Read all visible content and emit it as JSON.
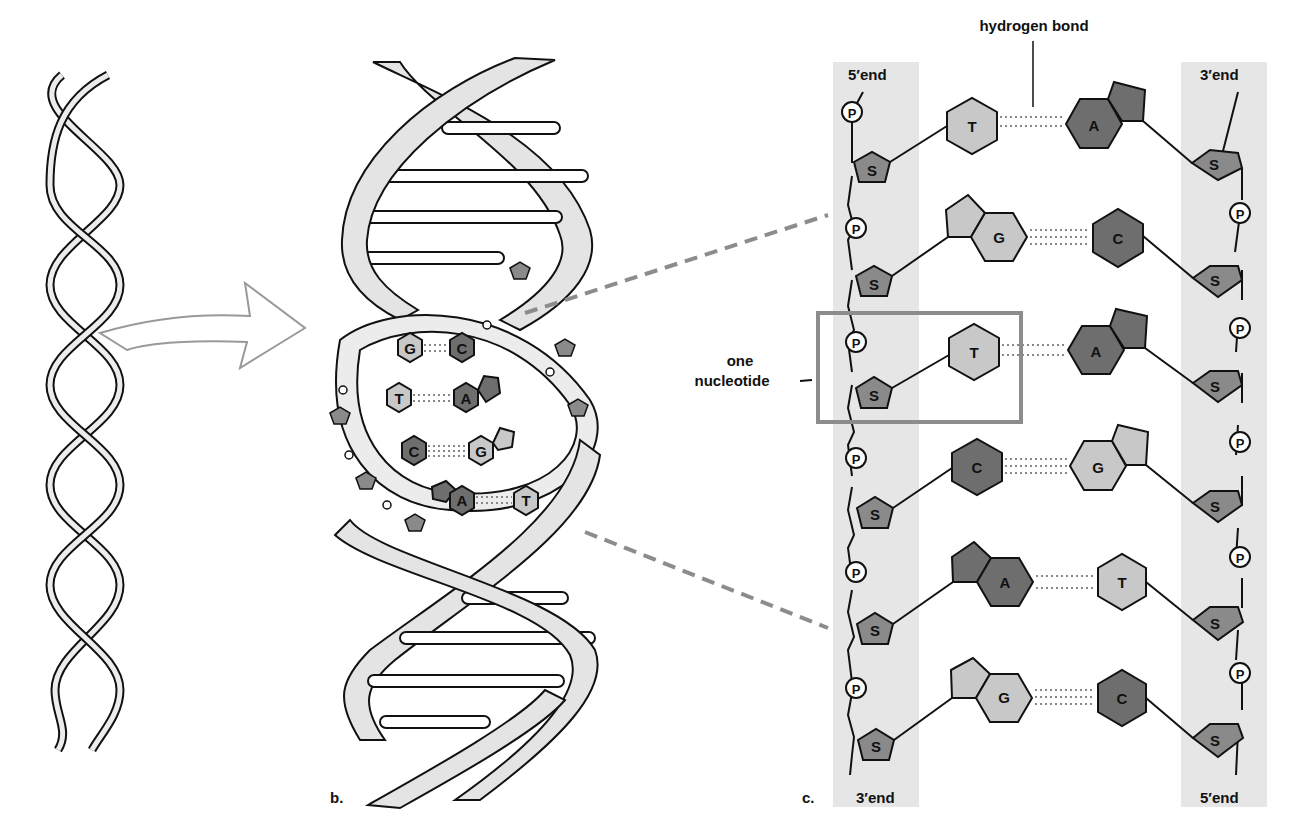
{
  "figure": {
    "panel_b_label": "b.",
    "panel_c_label": "c.",
    "hydrogen_bond_label": "hydrogen bond",
    "nucleotide_label_line1": "one",
    "nucleotide_label_line2": "nucleotide",
    "left_strand": {
      "top_label": "5′end",
      "bottom_label": "3′end"
    },
    "right_strand": {
      "top_label": "3′end",
      "bottom_label": "5′end"
    },
    "sugar_symbol": "S",
    "phosphate_symbol": "P"
  },
  "colors": {
    "backbone_shade": "#e6e6e6",
    "purine_dark": "#6e6e6e",
    "pyrimidine_light": "#c8c8c8",
    "sugar": "#8a8a8a",
    "box_outline": "#8c8c8c",
    "dash_connector": "#8c8c8c",
    "ribbon": "#e4e4e4"
  },
  "base_pairs": [
    {
      "left": "T",
      "right": "A",
      "bonds": 2
    },
    {
      "left": "G",
      "right": "C",
      "bonds": 3
    },
    {
      "left": "T",
      "right": "A",
      "bonds": 2,
      "highlighted_nucleotide": true
    },
    {
      "left": "C",
      "right": "G",
      "bonds": 3
    },
    {
      "left": "A",
      "right": "T",
      "bonds": 2
    },
    {
      "left": "G",
      "right": "C",
      "bonds": 3
    }
  ],
  "helix_inset_pairs": [
    {
      "left": "G",
      "right": "C"
    },
    {
      "left": "T",
      "right": "A"
    },
    {
      "left": "C",
      "right": "G"
    },
    {
      "left": "A",
      "right": "T"
    }
  ]
}
